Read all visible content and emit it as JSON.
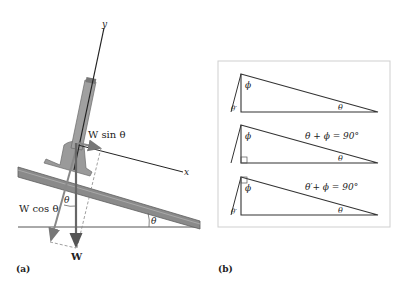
{
  "figure": {
    "panel_a": {
      "label": "(a)",
      "axis_y": "y",
      "axis_x": "x",
      "w_sin": "W sin θ",
      "w_cos": "W cos θ",
      "weight": "W",
      "theta_incline": "θ",
      "theta_vector": "θ"
    },
    "panel_b": {
      "label": "(b)",
      "triangles": [
        {
          "phi": "ϕ",
          "theta": "θ",
          "theta_prime": "θ′",
          "equation": ""
        },
        {
          "phi": "ϕ",
          "theta": "θ",
          "theta_prime": "",
          "equation": "θ + ϕ = 90°"
        },
        {
          "phi": "ϕ",
          "theta": "θ",
          "theta_prime": "θ′",
          "equation": "θ′+ ϕ = 90°"
        }
      ]
    },
    "colors": {
      "board": "#8a8a8a",
      "board_dark": "#5e5e5e",
      "pole": "#9a9a9a",
      "vector_gray": "#888888",
      "line": "#222222",
      "box_border": "#cfcfcf"
    }
  }
}
